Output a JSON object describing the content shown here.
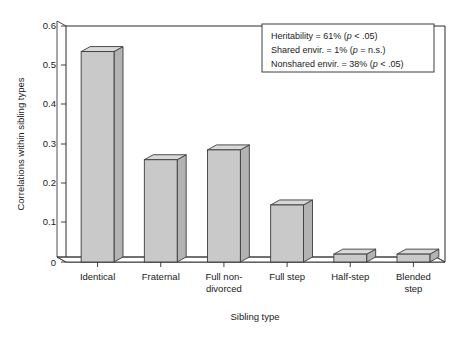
{
  "chart_data": {
    "type": "bar",
    "title": "",
    "xlabel": "Sibling type",
    "ylabel": "Correlations within sibling types",
    "categories": [
      "Identical",
      "Fraternal",
      "Full non-divorced",
      "Full step",
      "Half-step",
      "Blended step"
    ],
    "category_lines": [
      [
        "Identical"
      ],
      [
        "Fraternal"
      ],
      [
        "Full non-",
        "divorced"
      ],
      [
        "Full step"
      ],
      [
        "Half-step"
      ],
      [
        "Blended",
        "step"
      ]
    ],
    "values": [
      0.535,
      0.26,
      0.285,
      0.145,
      0.02,
      0.02
    ],
    "ylim": [
      0,
      0.6
    ],
    "yticks": [
      0,
      0.1,
      0.2,
      0.3,
      0.4,
      0.5,
      0.6
    ],
    "ytick_labels": [
      "0",
      "0.1",
      "0.2",
      "0.3",
      "0.4",
      "0.5",
      "0.6"
    ],
    "grid": false,
    "legend": "none",
    "style": "3d-bars",
    "bar_fill_color": "#c9c9c9",
    "bar_top_color": "#d8d8d8",
    "bar_side_color": "#b3b3b3",
    "axis_color": "#2b2b2b",
    "background_color": "#ffffff",
    "annotations": [
      "Heritability = 61% (p < .05)",
      "Shared envir. = 1% (p = n.s.)",
      "Nonshared envir. = 38% (p < .05)"
    ]
  },
  "stats_box": {
    "lines": [
      {
        "pre": "Heritability = 61% (",
        "italic": "p",
        "post": " < .05)"
      },
      {
        "pre": "Shared envir. = 1% (",
        "italic": "p",
        "post": " = n.s.)"
      },
      {
        "pre": "Nonshared envir. = 38% (",
        "italic": "p",
        "post": " < .05)"
      }
    ]
  },
  "axes": {
    "y_title": "Correlations within sibling types",
    "x_title": "Sibling type",
    "y_ticks": [
      "0.6",
      "0.5",
      "0.4",
      "0.3",
      "0.2",
      "0.1",
      "0"
    ]
  }
}
